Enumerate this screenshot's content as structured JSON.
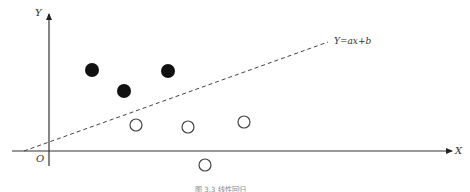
{
  "diagram": {
    "axes": {
      "x_label": "X",
      "y_label": "Y",
      "origin_label": "O"
    },
    "line": {
      "equation_label": "Y=ax+b",
      "style": "dashed"
    },
    "points": {
      "filled": [
        {
          "x": 92,
          "y": 70
        },
        {
          "x": 124,
          "y": 91
        },
        {
          "x": 168,
          "y": 71
        }
      ],
      "open": [
        {
          "x": 136,
          "y": 125
        },
        {
          "x": 188,
          "y": 127
        },
        {
          "x": 244,
          "y": 122
        },
        {
          "x": 205,
          "y": 165
        }
      ]
    },
    "caption": "图 3.3   线性回归"
  }
}
